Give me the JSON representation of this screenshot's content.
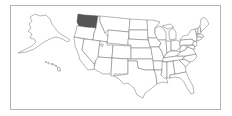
{
  "map": {
    "type": "locator-map",
    "region": "United States",
    "highlighted_state": "Washington",
    "insets": [
      "Alaska",
      "Hawaii"
    ],
    "colors": {
      "highlight": "#555555",
      "state_fill": "#ffffff",
      "state_border": "#6e6e6e",
      "frame_border": "#b4b4b4",
      "background": "#ffffff"
    }
  }
}
